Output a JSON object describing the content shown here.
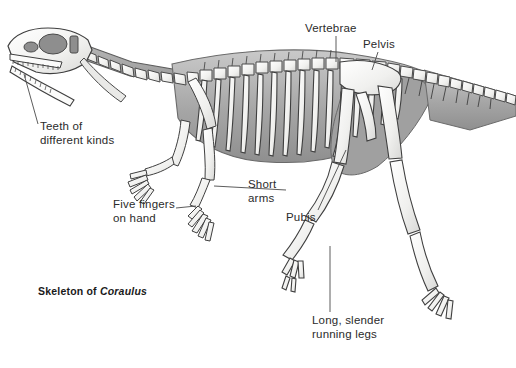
{
  "figure": {
    "type": "scientific-illustration",
    "background_color": "#ffffff",
    "ink_color": "#3a3a3a",
    "bone_fill_color": "#f2f2f0",
    "shadow_fill_color": "#a8a8a8",
    "body_silhouette_color": "#9e9e9e",
    "label_color": "#2b2b2b"
  },
  "caption": {
    "prefix": "Skeleton of ",
    "genus": "Coraulus"
  },
  "labels": {
    "vertebrae": "Vertebrae",
    "pelvis": "Pelvis",
    "teeth": "Teeth of\ndifferent kinds",
    "five_fingers": "Five fingers\non hand",
    "short_arms": "Short\narms",
    "pubis": "Pubis",
    "running_legs": "Long, slender\nrunning legs"
  },
  "anatomy": {
    "skull": "skull with open jaws and rows of small pointed teeth",
    "cervical_vertebrae_count": 10,
    "dorsal_rib_count": 15,
    "caudal_vertebrae_count": 18,
    "fingers_per_hand": 5,
    "toes_per_foot": 4
  }
}
